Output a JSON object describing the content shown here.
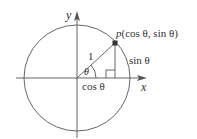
{
  "diagram": {
    "type": "unit-circle",
    "colors": {
      "stroke": "#555555",
      "text": "#333333",
      "point": "#333333",
      "background": "#ffffff"
    },
    "axes": {
      "x_label": "x",
      "y_label": "y"
    },
    "point_label": {
      "name": "p",
      "coords": "(cos θ, sin θ)"
    },
    "radius_label": "1",
    "angle_label": "θ",
    "adjacent_label": "cos θ",
    "opposite_label": "sin θ"
  }
}
